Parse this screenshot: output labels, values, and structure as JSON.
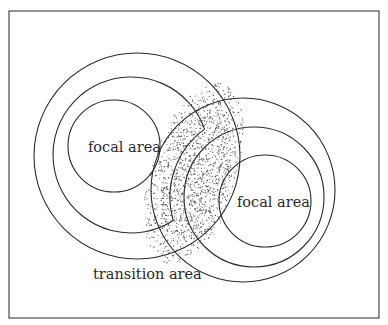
{
  "diagram": {
    "title": "",
    "labels": {
      "left_focal": "focal area",
      "right_focal": "focal area",
      "transition": "transition area"
    },
    "colors": {
      "line": "#2a2a2a",
      "stipple": "#555555",
      "background": "#ffffff"
    },
    "frame": {
      "x": 9,
      "y": 11,
      "width": 370,
      "height": 307
    },
    "left_group": {
      "center_inner": [
        114,
        146
      ],
      "inner_radius": 46,
      "middle_center": [
        131,
        155
      ],
      "middle_radius": 78,
      "outer_center": [
        137,
        156
      ],
      "outer_radius": 103
    },
    "right_group": {
      "inner_center": [
        265,
        201
      ],
      "inner_radius": 46,
      "middle_center": [
        254,
        197
      ],
      "middle_radius": 70,
      "outer_center": [
        243,
        190
      ],
      "outer_radius": 92
    },
    "transition_zone": {
      "shape": "stippled lens",
      "cx": 194,
      "cy": 174,
      "rx": 44,
      "ry": 95,
      "rotate": 17
    }
  }
}
